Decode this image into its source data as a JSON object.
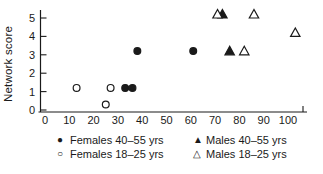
{
  "figure": {
    "background": "#ffffff",
    "ink_color": "#1a1a1a"
  },
  "chart_data": {
    "type": "scatter",
    "title": "",
    "xlabel": "",
    "ylabel": "Network score",
    "xlim": [
      0,
      109
    ],
    "ylim": [
      0,
      5.5
    ],
    "x_ticks": [
      0,
      10,
      20,
      30,
      40,
      50,
      60,
      70,
      80,
      90,
      100
    ],
    "y_ticks": [
      0,
      1,
      2,
      3,
      4,
      5
    ],
    "grid": false,
    "legend_position": "bottom",
    "series": [
      {
        "name": "Females 40–55 yrs",
        "marker": "filled-circle",
        "color": "#1a1a1a",
        "points": [
          [
            33,
            1.2
          ],
          [
            36,
            1.2
          ],
          [
            38,
            3.2
          ],
          [
            61,
            3.2
          ]
        ]
      },
      {
        "name": "Females 18–25 yrs",
        "marker": "open-circle",
        "color": "#1a1a1a",
        "points": [
          [
            13,
            1.2
          ],
          [
            25,
            0.3
          ],
          [
            27,
            1.2
          ]
        ]
      },
      {
        "name": "Males 40–55 yrs",
        "marker": "filled-triangle",
        "color": "#1a1a1a",
        "points": [
          [
            73,
            5.2
          ],
          [
            76,
            3.2
          ]
        ]
      },
      {
        "name": "Males 18–25 yrs",
        "marker": "open-triangle",
        "color": "#1a1a1a",
        "points": [
          [
            71,
            5.2
          ],
          [
            82,
            3.2
          ],
          [
            86,
            5.2
          ],
          [
            103,
            4.2
          ]
        ]
      }
    ]
  },
  "legend": {
    "items": [
      {
        "symbol": "●",
        "label": "Females 40–55 yrs",
        "marker": "filled-circle"
      },
      {
        "symbol": "○",
        "label": "Females 18–25 yrs",
        "marker": "open-circle"
      },
      {
        "symbol": "▲",
        "label": "Males 40–55 yrs",
        "marker": "filled-triangle"
      },
      {
        "symbol": "△",
        "label": "Males 18–25 yrs",
        "marker": "open-triangle"
      }
    ]
  }
}
